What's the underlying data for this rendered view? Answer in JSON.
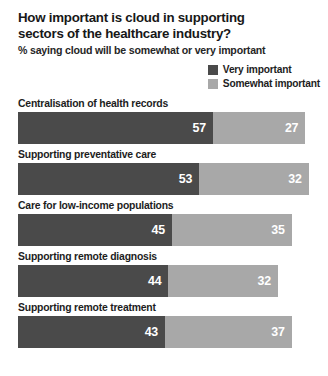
{
  "chart_data": {
    "type": "bar",
    "orientation": "horizontal",
    "stacked": true,
    "title": "How important is cloud in supporting sectors of the healthcare industry?",
    "subtitle": "% saying cloud will be somewhat or very important",
    "xlabel": "",
    "ylabel": "",
    "grid": false,
    "legend_position": "top-right",
    "categories": [
      "Centralisation of health records",
      "Supporting preventative care",
      "Care for low-income populations",
      "Supporting remote diagnosis",
      "Supporting remote treatment"
    ],
    "series": [
      {
        "name": "Very important",
        "color": "#4a4a4a",
        "values": [
          57,
          53,
          45,
          44,
          43
        ]
      },
      {
        "name": "Somewhat important",
        "color": "#a8a8a8",
        "values": [
          27,
          32,
          35,
          32,
          37
        ]
      }
    ],
    "totals": [
      84,
      85,
      80,
      76,
      80
    ],
    "xlim": [
      0,
      85
    ],
    "value_label_color": "#ffffff"
  },
  "title": {
    "line1": "How important is cloud in supporting",
    "line2": "sectors of the healthcare industry?"
  },
  "subtitle": "% saying cloud will be somewhat or very important",
  "legend": {
    "items": [
      {
        "label": "Very important",
        "color": "#4a4a4a"
      },
      {
        "label": "Somewhat important",
        "color": "#a8a8a8"
      }
    ]
  },
  "bars": [
    {
      "label": "Centralisation of health records",
      "very": "57",
      "somewhat": "27",
      "very_value": 57,
      "somewhat_value": 27
    },
    {
      "label": "Supporting preventative care",
      "very": "53",
      "somewhat": "32",
      "very_value": 53,
      "somewhat_value": 32
    },
    {
      "label": "Care for low-income populations",
      "very": "45",
      "somewhat": "35",
      "very_value": 45,
      "somewhat_value": 35
    },
    {
      "label": "Supporting remote diagnosis",
      "very": "44",
      "somewhat": "32",
      "very_value": 44,
      "somewhat_value": 32
    },
    {
      "label": "Supporting remote treatment",
      "very": "43",
      "somewhat": "37",
      "very_value": 43,
      "somewhat_value": 37
    }
  ],
  "scale": {
    "px_per_unit": 3.42
  }
}
